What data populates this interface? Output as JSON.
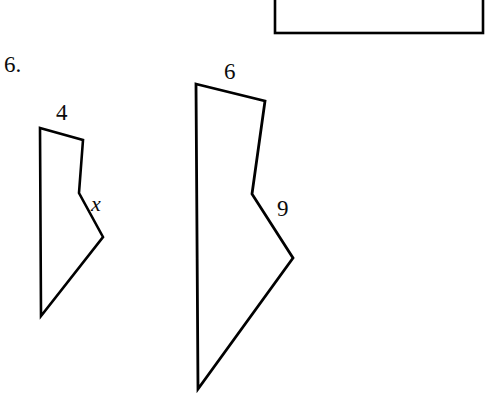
{
  "worksheet": {
    "problem_number": "6.",
    "background_color": "#ffffff",
    "stroke_color": "#000000"
  },
  "answer_box": {
    "name": "answer-box",
    "x": 275,
    "y": -14,
    "width": 208,
    "height": 47,
    "stroke_width": 2.6
  },
  "figures": [
    {
      "id": "small-polygon",
      "role": "pre-image",
      "points": "40,128 83,140 79,193 103,237 41,316",
      "stroke_width": 2.6,
      "labels": [
        {
          "name": "side-length-top",
          "text": "4",
          "x": 56,
          "y": 101
        },
        {
          "name": "side-length-unknown",
          "text": "x",
          "x": 91,
          "y": 193,
          "italic": true
        }
      ]
    },
    {
      "id": "large-polygon",
      "role": "image",
      "points": "196,84 265,101 252,194 293,258 198,389",
      "stroke_width": 2.8,
      "labels": [
        {
          "name": "side-length-top",
          "text": "6",
          "x": 224,
          "y": 60
        },
        {
          "name": "side-length-known",
          "text": "9",
          "x": 277,
          "y": 197
        }
      ]
    }
  ],
  "labels": {
    "problem_number": "6.",
    "small_top": "4",
    "small_side": "x",
    "large_top": "6",
    "large_side": "9"
  }
}
